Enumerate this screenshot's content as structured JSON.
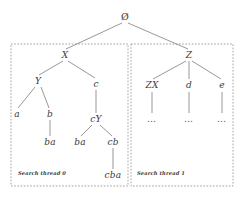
{
  "figure": {
    "type": "tree-diagram",
    "background_color": "#ffffff",
    "line_color": "#6b6b6b",
    "text_color": "#3a3a3a",
    "box_border_color": "#8a8a8a"
  },
  "root": {
    "label": "Ø",
    "x": 125,
    "y": 17
  },
  "nodes": [
    {
      "id": "root",
      "label": "Ø",
      "x": 125,
      "y": 17,
      "style": "root"
    },
    {
      "id": "X",
      "label": "X",
      "x": 65,
      "y": 55,
      "style": "italic"
    },
    {
      "id": "Z",
      "label": "Z",
      "x": 189,
      "y": 55,
      "style": "italic"
    },
    {
      "id": "Y",
      "label": "Y",
      "x": 38,
      "y": 81,
      "style": "italic"
    },
    {
      "id": "c",
      "label": "c",
      "x": 96,
      "y": 84,
      "style": "italic"
    },
    {
      "id": "a",
      "label": "a",
      "x": 17,
      "y": 114,
      "style": "italic"
    },
    {
      "id": "b",
      "label": "b",
      "x": 50,
      "y": 114,
      "style": "italic"
    },
    {
      "id": "cY",
      "label": "cY",
      "x": 96,
      "y": 119,
      "style": "italic"
    },
    {
      "id": "ba-left",
      "label": "ba",
      "x": 50,
      "y": 142,
      "style": "italic"
    },
    {
      "id": "ba-right",
      "label": "ba",
      "x": 80,
      "y": 142,
      "style": "italic"
    },
    {
      "id": "cb",
      "label": "cb",
      "x": 113,
      "y": 142,
      "style": "italic"
    },
    {
      "id": "cba",
      "label": "cba",
      "x": 113,
      "y": 175,
      "style": "italic"
    },
    {
      "id": "ZX",
      "label": "ZX",
      "x": 152,
      "y": 85,
      "style": "italic"
    },
    {
      "id": "d",
      "label": "d",
      "x": 189,
      "y": 85,
      "style": "italic"
    },
    {
      "id": "e",
      "label": "e",
      "x": 222,
      "y": 85,
      "style": "italic"
    },
    {
      "id": "dots-ZX",
      "label": "…",
      "x": 152,
      "y": 119,
      "style": "ellipsis"
    },
    {
      "id": "dots-d",
      "label": "…",
      "x": 189,
      "y": 119,
      "style": "ellipsis"
    },
    {
      "id": "dots-e",
      "label": "…",
      "x": 222,
      "y": 119,
      "style": "ellipsis"
    }
  ],
  "edges": [
    {
      "from": "root",
      "to": "X",
      "x1": 122,
      "y1": 23,
      "x2": 66,
      "y2": 49
    },
    {
      "from": "root",
      "to": "Z",
      "x1": 128,
      "y1": 23,
      "x2": 188,
      "y2": 49
    },
    {
      "from": "X",
      "to": "Y",
      "x1": 63,
      "y1": 61,
      "x2": 39,
      "y2": 75
    },
    {
      "from": "X",
      "to": "c",
      "x1": 68,
      "y1": 61,
      "x2": 95,
      "y2": 78
    },
    {
      "from": "Y",
      "to": "a",
      "x1": 35,
      "y1": 87,
      "x2": 18,
      "y2": 108
    },
    {
      "from": "Y",
      "to": "b",
      "x1": 41,
      "y1": 87,
      "x2": 49,
      "y2": 108
    },
    {
      "from": "b",
      "to": "ba-left",
      "x1": 50,
      "y1": 120,
      "x2": 50,
      "y2": 136
    },
    {
      "from": "c",
      "to": "cY",
      "x1": 96,
      "y1": 90,
      "x2": 96,
      "y2": 113
    },
    {
      "from": "cY",
      "to": "ba-right",
      "x1": 92,
      "y1": 125,
      "x2": 81,
      "y2": 136
    },
    {
      "from": "cY",
      "to": "cb",
      "x1": 100,
      "y1": 125,
      "x2": 112,
      "y2": 136
    },
    {
      "from": "cb",
      "to": "cba",
      "x1": 113,
      "y1": 148,
      "x2": 113,
      "y2": 169
    },
    {
      "from": "Z",
      "to": "ZX",
      "x1": 186,
      "y1": 61,
      "x2": 153,
      "y2": 79
    },
    {
      "from": "Z",
      "to": "d",
      "x1": 189,
      "y1": 61,
      "x2": 189,
      "y2": 79
    },
    {
      "from": "Z",
      "to": "e",
      "x1": 192,
      "y1": 61,
      "x2": 221,
      "y2": 79
    },
    {
      "from": "ZX",
      "to": "dots-ZX",
      "x1": 152,
      "y1": 92,
      "x2": 152,
      "y2": 113
    },
    {
      "from": "d",
      "to": "dots-d",
      "x1": 189,
      "y1": 92,
      "x2": 189,
      "y2": 113
    },
    {
      "from": "e",
      "to": "dots-e",
      "x1": 222,
      "y1": 92,
      "x2": 222,
      "y2": 113
    }
  ],
  "thread_boxes": [
    {
      "id": "thread-0",
      "caption": "Search thread 0",
      "x": 11,
      "y": 44,
      "width": 117,
      "height": 142,
      "caption_x": 18,
      "caption_y": 170
    },
    {
      "id": "thread-1",
      "caption": "Search thread 1",
      "x": 131,
      "y": 44,
      "width": 102,
      "height": 142,
      "caption_x": 137,
      "caption_y": 170
    }
  ]
}
